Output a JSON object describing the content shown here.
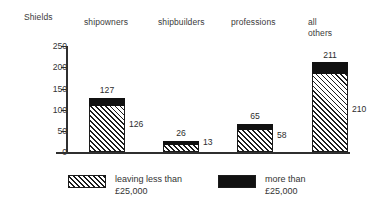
{
  "chart_data": {
    "type": "bar",
    "title": "Shields",
    "xlabel": "",
    "ylabel": "",
    "ylim": [
      0,
      250
    ],
    "yticks": [
      0,
      50,
      100,
      150,
      200,
      250
    ],
    "grid": false,
    "stacked": true,
    "legend_position": "bottom",
    "categories": [
      "shipowners",
      "shipbuilders",
      "professions",
      "all\nothers"
    ],
    "series": [
      {
        "name": "leaving less than\n£25,000",
        "fill": "hatched",
        "color": "#1c1c1c",
        "values": [
          127,
          26,
          65,
          211
        ]
      },
      {
        "name": "more than\n£25,000",
        "fill": "solid",
        "color": "#111111",
        "values": [
          126,
          13,
          58,
          210
        ]
      }
    ],
    "annotations": {
      "top_labels": [
        "127",
        "26",
        "65",
        "211"
      ],
      "side_labels": [
        "126",
        "13",
        "58",
        "210"
      ]
    }
  },
  "header": {
    "title": "Shields"
  },
  "axis": {
    "tick_labels": [
      "250",
      "200",
      "150",
      "100",
      "50",
      "0"
    ]
  },
  "categories": {
    "shipowners": "shipowners",
    "shipbuilders": "shipbuilders",
    "professions": "professions",
    "all_others": "all\nothers"
  },
  "bars": [
    {
      "key": "shipowners",
      "top_label": "127",
      "side_label": "126"
    },
    {
      "key": "shipbuilders",
      "top_label": "26",
      "side_label": "13"
    },
    {
      "key": "professions",
      "top_label": "65",
      "side_label": "58"
    },
    {
      "key": "all_others",
      "top_label": "211",
      "side_label": "210"
    }
  ],
  "legend": {
    "items": [
      {
        "label": "leaving less  than\n£25,000",
        "fill": "hatched"
      },
      {
        "label": "more than\n£25,000",
        "fill": "solid"
      }
    ]
  }
}
